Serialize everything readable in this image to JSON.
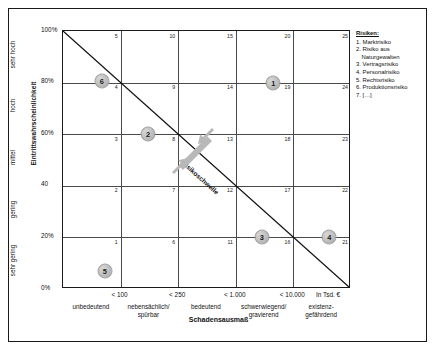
{
  "axes": {
    "y_title": "Eintrittswahrscheinlichkeit",
    "x_title": "Schadensausmaß",
    "x_unit": "In Tsd. €"
  },
  "chart_data": {
    "type": "scatter",
    "title": "",
    "xlabel": "Schadensausmaß",
    "ylabel": "Eintrittswahrscheinlichkeit",
    "grid": true,
    "xlim": [
      0,
      5
    ],
    "ylim": [
      0,
      100
    ],
    "y_tick_labels": [
      "100%",
      "80%",
      "60%",
      "40",
      "20%",
      "0%"
    ],
    "y_tick_values": [
      100,
      80,
      60,
      40,
      20,
      0
    ],
    "y_categories": [
      "sehr hoch",
      "hoch",
      "mittel",
      "gering",
      "sehr gering"
    ],
    "x_tick_labels": [
      "< 100",
      "< 250",
      "< 1.000",
      "< 10.000"
    ],
    "x_categories": [
      "unbedeutend",
      "nebensächlich/\nspürbar",
      "bedeutend",
      "schwerwiegend/\ngravierend",
      "existenz-\ngefährdend"
    ],
    "cell_numbers": [
      [
        5,
        10,
        15,
        20,
        25
      ],
      [
        4,
        9,
        14,
        19,
        24
      ],
      [
        3,
        8,
        13,
        18,
        23
      ],
      [
        2,
        7,
        12,
        17,
        22
      ],
      [
        1,
        6,
        11,
        16,
        21
      ]
    ],
    "threshold_label": "Risikoschwelle",
    "threshold_line": {
      "from": [
        0,
        100
      ],
      "to": [
        5,
        0
      ]
    },
    "points": [
      {
        "label": "1",
        "x_pct": 73.0,
        "y_pct": 80.0
      },
      {
        "label": "2",
        "x_pct": 29.5,
        "y_pct": 60.0
      },
      {
        "label": "3",
        "x_pct": 69.0,
        "y_pct": 20.0
      },
      {
        "label": "4",
        "x_pct": 92.5,
        "y_pct": 20.0
      },
      {
        "label": "5",
        "x_pct": 14.5,
        "y_pct": 7.0
      },
      {
        "label": "6",
        "x_pct": 13.5,
        "y_pct": 80.5
      }
    ]
  },
  "legend": {
    "title": "Risiken:",
    "items": [
      {
        "num": "1.",
        "text": "Marktrisiko",
        "cont": ""
      },
      {
        "num": "2.",
        "text": "Risiko aus",
        "cont": "Naturgewalten"
      },
      {
        "num": "3.",
        "text": "Vertragsrisiko",
        "cont": ""
      },
      {
        "num": "4.",
        "text": "Personalrisiko",
        "cont": ""
      },
      {
        "num": "5.",
        "text": "Rechtsrisiko",
        "cont": ""
      },
      {
        "num": "6.",
        "text": "Produktionsrisiko",
        "cont": ""
      },
      {
        "num": "7.",
        "text": "[…]",
        "cont": ""
      }
    ]
  }
}
